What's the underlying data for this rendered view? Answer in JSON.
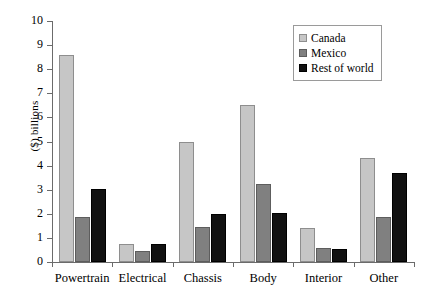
{
  "chart_data": {
    "type": "bar",
    "title": "",
    "subtitle": "",
    "xlabel": "",
    "ylabel": "($) billions",
    "ylim": [
      0,
      10
    ],
    "yticks": [
      0,
      1,
      2,
      3,
      4,
      5,
      6,
      7,
      8,
      9,
      10
    ],
    "ytick_labels": [
      "0",
      "1",
      "2",
      "3",
      "4",
      "5",
      "6",
      "7",
      "8",
      "9",
      "10"
    ],
    "grid": false,
    "legend_position": "top-right",
    "categories": [
      "Powertrain",
      "Electrical",
      "Chassis",
      "Body",
      "Interior",
      "Other"
    ],
    "series": [
      {
        "name": "Canada",
        "color": "#c6c6c6",
        "values": [
          8.6,
          0.75,
          5.0,
          6.5,
          1.4,
          4.3
        ]
      },
      {
        "name": "Mexico",
        "color": "#808080",
        "values": [
          1.85,
          0.45,
          1.45,
          3.25,
          0.6,
          1.85
        ]
      },
      {
        "name": "Rest of world",
        "color": "#111111",
        "values": [
          3.05,
          0.75,
          2.0,
          2.05,
          0.55,
          3.7
        ]
      }
    ]
  },
  "legend": {
    "items": [
      {
        "label": "Canada",
        "swatch": "canada"
      },
      {
        "label": "Mexico",
        "swatch": "mexico"
      },
      {
        "label": "Rest of world",
        "swatch": "row"
      }
    ]
  }
}
